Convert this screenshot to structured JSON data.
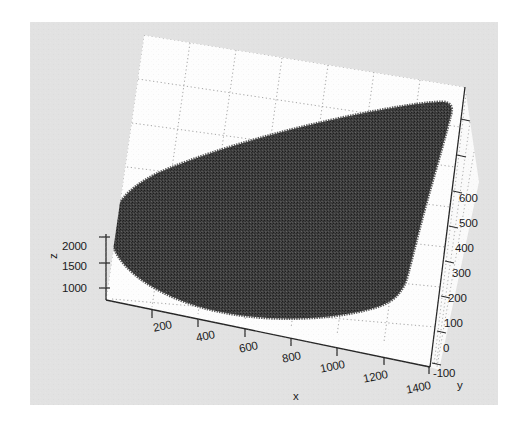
{
  "figure": {
    "type": "matlab-3d-scatter-figure",
    "background_color": "#e2e2e2",
    "axes_wall_color": "#ffffff",
    "grid_color": "#9a9a9a",
    "axis_line_color": "#2a2a2a",
    "point_color": "#3a3a3a",
    "page_background": "#ffffff"
  },
  "chart_data": {
    "type": "scatter",
    "projection": "3d",
    "title": "",
    "xlabel": "x",
    "ylabel": "y",
    "zlabel": "z",
    "xticks": [
      200,
      400,
      600,
      800,
      1000,
      1200,
      1400
    ],
    "xticklabels": [
      "200",
      "400",
      "600",
      "800",
      "1000",
      "1200",
      "1400"
    ],
    "yticks": [
      -100,
      0,
      100,
      200,
      300,
      400,
      500,
      600
    ],
    "yticklabels": [
      "-100",
      "0",
      "100",
      "200",
      "300",
      "400",
      "500",
      "600"
    ],
    "zticks": [
      1000,
      1500,
      2000
    ],
    "zticklabels": [
      "1000",
      "1500",
      "2000"
    ],
    "xlim": [
      100,
      1500
    ],
    "ylim": [
      -150,
      650
    ],
    "zlim": [
      800,
      2200
    ],
    "grid": true,
    "legend": null,
    "marker": "point",
    "marker_color": "#3a3a3a",
    "point_count_estimate": 60000,
    "series": [
      {
        "name": "point cloud",
        "color": "#3a3a3a",
        "x": [
          150,
          250,
          350,
          450,
          550,
          650,
          750,
          850,
          950,
          1050,
          1150,
          1250,
          1350,
          1450
        ],
        "y": [
          300,
          300,
          300,
          300,
          300,
          300,
          300,
          300,
          300,
          300,
          300,
          300,
          300,
          300
        ],
        "z": [
          1700,
          1750,
          1800,
          1850,
          1900,
          1950,
          2000,
          2050,
          2080,
          2100,
          2120,
          2130,
          2140,
          2150
        ]
      }
    ]
  },
  "axes": {
    "x": {
      "name": "x",
      "ticks": [
        {
          "label": "200",
          "left": 152,
          "top": 322
        },
        {
          "label": "400",
          "left": 195,
          "top": 332
        },
        {
          "label": "600",
          "left": 238,
          "top": 343
        },
        {
          "label": "800",
          "left": 281,
          "top": 353
        },
        {
          "label": "1000",
          "left": 319,
          "top": 363
        },
        {
          "label": "1200",
          "left": 362,
          "top": 373
        },
        {
          "label": "1400",
          "left": 405,
          "top": 384
        }
      ],
      "name_left": 293,
      "name_top": 390
    },
    "y": {
      "name": "y",
      "ticks": [
        {
          "label": "600",
          "left": 459,
          "top": 192
        },
        {
          "label": "500",
          "left": 459,
          "top": 217
        },
        {
          "label": "400",
          "left": 455,
          "top": 242
        },
        {
          "label": "300",
          "left": 452,
          "top": 267
        },
        {
          "label": "200",
          "left": 448,
          "top": 292
        },
        {
          "label": "100",
          "left": 444,
          "top": 317
        },
        {
          "label": "0",
          "left": 443,
          "top": 342
        },
        {
          "label": "-100",
          "left": 433,
          "top": 367
        }
      ],
      "name_left": 457,
      "name_top": 379
    },
    "z": {
      "name": "z",
      "ticks": [
        {
          "label": "2000",
          "left": 62,
          "top": 240
        },
        {
          "label": "1500",
          "left": 62,
          "top": 260
        },
        {
          "label": "1000",
          "left": 62,
          "top": 282
        }
      ],
      "name_left": 47,
      "name_top": 259
    }
  }
}
